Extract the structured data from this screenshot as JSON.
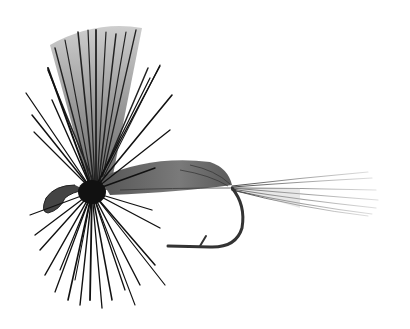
{
  "image": {
    "subject": "dry fly fishing lure illustration",
    "style": "grayscale ink drawing",
    "background": "#ffffff"
  },
  "colors": {
    "ink": "#111111",
    "dark": "#2a2a2a",
    "wing": "#8a8a8a",
    "wing_light": "#b5b5b5",
    "body": "#7a7a7a",
    "tail": "#9a9a9a"
  },
  "parts": {
    "wing": {
      "origin": [
        95,
        185
      ],
      "top_left": [
        48,
        40
      ],
      "top_right": [
        140,
        28
      ]
    },
    "hackle_center": [
      92,
      190
    ],
    "body": {
      "start": [
        100,
        180
      ],
      "end": [
        232,
        188
      ]
    },
    "tail": {
      "start": [
        232,
        188
      ],
      "end": [
        380,
        210
      ]
    },
    "hook": {
      "bend_x": 240,
      "bottom_y": 247,
      "point_x": 168
    },
    "eye": {
      "cx": 46,
      "cy": 205
    }
  }
}
